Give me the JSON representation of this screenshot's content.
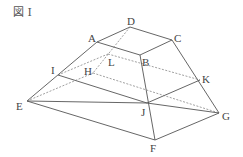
{
  "figure": {
    "title": "図 I",
    "vertices": {
      "A": {
        "label": "A",
        "x": 97,
        "y": 42
      },
      "B": {
        "label": "B",
        "x": 140,
        "y": 55
      },
      "C": {
        "label": "C",
        "x": 172,
        "y": 40
      },
      "D": {
        "label": "D",
        "x": 130,
        "y": 27
      },
      "E": {
        "label": "E",
        "x": 27,
        "y": 101
      },
      "F": {
        "label": "F",
        "x": 155,
        "y": 140
      },
      "G": {
        "label": "G",
        "x": 219,
        "y": 113
      },
      "H": {
        "label": "H",
        "x": 93,
        "y": 73
      },
      "I": {
        "label": "I",
        "x": 58,
        "y": 75
      },
      "J": {
        "label": "J",
        "x": 147,
        "y": 103
      },
      "K": {
        "label": "K",
        "x": 200,
        "y": 80
      },
      "L": {
        "label": "L",
        "x": 108,
        "y": 54
      }
    },
    "solid_edges": [
      "AB",
      "BC",
      "CD",
      "DA",
      "AE",
      "BF",
      "CG",
      "EF",
      "FG",
      "EJ",
      "JG",
      "IJ",
      "JK"
    ],
    "dashed_edges": [
      "DH",
      "EH",
      "HG",
      "IL",
      "LK",
      "EL"
    ],
    "line_color": "#555555"
  }
}
